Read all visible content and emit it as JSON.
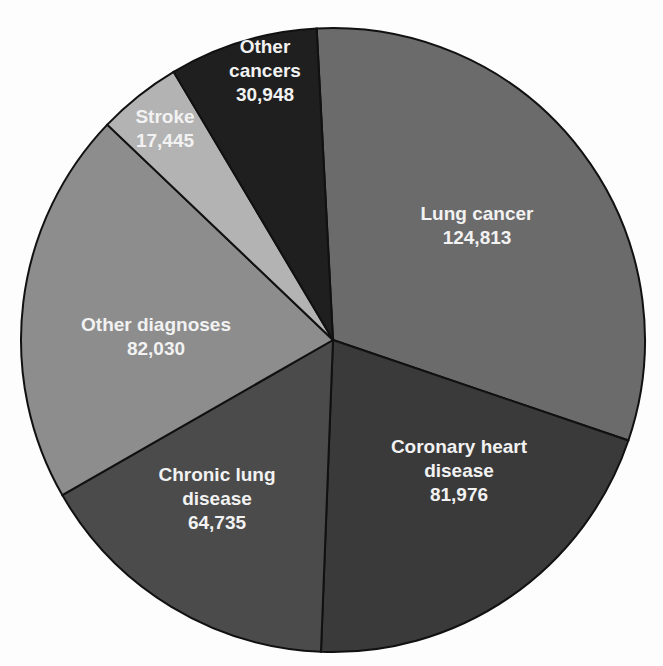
{
  "chart_data": {
    "type": "pie",
    "title": "",
    "start_angle_deg": -3,
    "direction": "clockwise",
    "total": 401947,
    "slices": [
      {
        "name": "Lung cancer",
        "label_lines": [
          "Lung cancer",
          "124,813"
        ],
        "value": 124813,
        "color": "#6b6b6b",
        "label_pos": [
          477,
          225
        ]
      },
      {
        "name": "Coronary heart disease",
        "label_lines": [
          "Coronary heart",
          "disease",
          "81,976"
        ],
        "value": 81976,
        "color": "#3a3a3a",
        "label_pos": [
          459,
          470
        ]
      },
      {
        "name": "Chronic lung disease",
        "label_lines": [
          "Chronic lung",
          "disease",
          "64,735"
        ],
        "value": 64735,
        "color": "#4b4b4b",
        "label_pos": [
          217,
          498
        ]
      },
      {
        "name": "Other diagnoses",
        "label_lines": [
          "Other diagnoses",
          "82,030"
        ],
        "value": 82030,
        "color": "#8d8d8d",
        "label_pos": [
          156,
          336
        ]
      },
      {
        "name": "Stroke",
        "label_lines": [
          "Stroke",
          "17,445"
        ],
        "value": 17445,
        "color": "#b3b3b3",
        "label_pos": [
          165,
          128
        ]
      },
      {
        "name": "Other cancers",
        "label_lines": [
          "Other",
          "cancers",
          "30,948"
        ],
        "value": 30948,
        "color": "#1f1f1f",
        "label_pos": [
          265,
          70
        ]
      }
    ],
    "center": [
      333,
      340
    ],
    "radius": 312
  }
}
